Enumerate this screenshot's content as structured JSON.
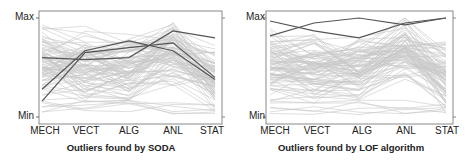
{
  "chart_data": [
    {
      "type": "line",
      "subtype": "parallel-coordinates",
      "title": "Outliers found by SODA",
      "categories": [
        "MECH",
        "VECT",
        "ALG",
        "ANL",
        "STAT"
      ],
      "y_ticks": [
        "Max",
        "Min"
      ],
      "ylim": [
        0,
        1
      ],
      "grid": false,
      "background_line_color": "#c8c8c8",
      "highlight_line_color": "#555555",
      "highlighted_series": [
        {
          "name": "outlier-1",
          "values": [
            0.6,
            0.58,
            0.6,
            0.87,
            0.8
          ]
        },
        {
          "name": "outlier-2",
          "values": [
            0.28,
            0.67,
            0.77,
            0.67,
            0.38
          ]
        },
        {
          "name": "outlier-3",
          "values": [
            0.16,
            0.65,
            0.7,
            0.75,
            0.4
          ]
        }
      ],
      "background_series_count": 88
    },
    {
      "type": "line",
      "subtype": "parallel-coordinates",
      "title": "Outliers found by LOF algorithm",
      "categories": [
        "MECH",
        "VECT",
        "ALG",
        "ANL",
        "STAT"
      ],
      "y_ticks": [
        "Max",
        "Min"
      ],
      "ylim": [
        0,
        1
      ],
      "grid": false,
      "background_line_color": "#c8c8c8",
      "highlight_line_color": "#555555",
      "highlighted_series": [
        {
          "name": "outlier-1",
          "values": [
            0.97,
            0.87,
            0.8,
            0.95,
            1.0
          ]
        },
        {
          "name": "outlier-2",
          "values": [
            0.82,
            0.95,
            1.0,
            0.93,
            1.0
          ]
        }
      ],
      "background_series_count": 88
    }
  ],
  "left": {
    "y_max_label": "Max",
    "y_min_label": "Min",
    "x_labels": [
      "MECH",
      "VECT",
      "ALG",
      "ANL",
      "STAT"
    ],
    "caption": "Outliers found by SODA"
  },
  "right": {
    "y_max_label": "Max",
    "y_min_label": "Min",
    "x_labels": [
      "MECH",
      "VECT",
      "ALG",
      "ANL",
      "STAT"
    ],
    "caption": "Outliers found by LOF algorithm"
  }
}
